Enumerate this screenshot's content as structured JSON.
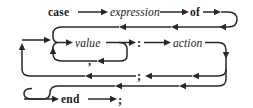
{
  "diagram": {
    "kind": "railroad-syntax-diagram",
    "background_color": "#ffffff",
    "ink_color": "#2a2724",
    "nodes": {
      "case_keyword": "case",
      "expression": "expression",
      "of_keyword": "of",
      "value": "value",
      "colon": ":",
      "action": "action",
      "comma": ",",
      "semicolon_loop": ";",
      "end_keyword": "end",
      "semicolon_final": ";"
    },
    "node_list": [
      {
        "id": "case",
        "label": "case",
        "type": "terminal",
        "row": 1
      },
      {
        "id": "expression",
        "label": "expression",
        "type": "nonterminal",
        "row": 1
      },
      {
        "id": "of",
        "label": "of",
        "type": "terminal",
        "row": 1
      },
      {
        "id": "value",
        "label": "value",
        "type": "nonterminal",
        "row": 3
      },
      {
        "id": "colon",
        "label": ":",
        "type": "terminal",
        "row": 3
      },
      {
        "id": "action",
        "label": "action",
        "type": "nonterminal",
        "row": 3
      },
      {
        "id": "comma",
        "label": ",",
        "type": "terminal",
        "row": 4
      },
      {
        "id": "semicolon",
        "label": ";",
        "type": "terminal",
        "row": 5
      },
      {
        "id": "end",
        "label": "end",
        "type": "terminal",
        "row": 7
      },
      {
        "id": "semicolon-final",
        "label": ";",
        "type": "terminal",
        "row": 7
      }
    ]
  }
}
